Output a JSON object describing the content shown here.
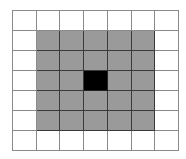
{
  "grid": {
    "rows": 7,
    "cols": 7,
    "colors": {
      "0": "#ffffff",
      "1": "#9a9a9a",
      "2": "#000000"
    },
    "cells": [
      [
        0,
        0,
        0,
        0,
        0,
        0,
        0
      ],
      [
        0,
        1,
        1,
        1,
        1,
        1,
        0
      ],
      [
        0,
        1,
        1,
        1,
        1,
        1,
        0
      ],
      [
        0,
        1,
        1,
        2,
        1,
        1,
        0
      ],
      [
        0,
        1,
        1,
        1,
        1,
        1,
        0
      ],
      [
        0,
        1,
        1,
        1,
        1,
        1,
        0
      ],
      [
        0,
        0,
        0,
        0,
        0,
        0,
        0
      ]
    ]
  }
}
